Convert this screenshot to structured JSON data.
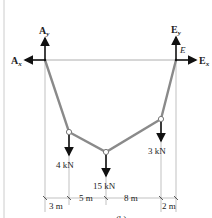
{
  "diagram": {
    "caption": "(b)",
    "supports": {
      "A": {
        "horizontal_label": "A",
        "horizontal_sub": "x",
        "vertical_label": "A",
        "vertical_sub": "y"
      },
      "E": {
        "point_label": "E",
        "horizontal_label": "E",
        "horizontal_sub": "x",
        "vertical_label": "E",
        "vertical_sub": "y"
      }
    },
    "loads": [
      {
        "name": "load-B",
        "label": "4 kN"
      },
      {
        "name": "load-C",
        "label": "15 kN"
      },
      {
        "name": "load-D",
        "label": "3 kN"
      }
    ],
    "dimensions": [
      {
        "label": "3 m"
      },
      {
        "label": "5 m"
      },
      {
        "label": "8 m"
      },
      {
        "label": "2 m"
      }
    ]
  }
}
